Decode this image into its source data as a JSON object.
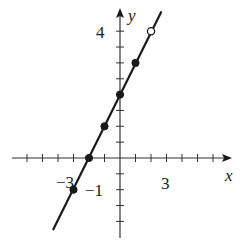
{
  "chart_data": {
    "type": "line",
    "title": "",
    "xlabel": "x",
    "ylabel": "y",
    "equation": "y = x + 2",
    "x_tick_labels": [
      "-3",
      "3"
    ],
    "y_tick_labels": [
      "4",
      "-1"
    ],
    "x_tick_step": 1,
    "y_tick_step": 0.5,
    "xlim": [
      -6.5,
      7
    ],
    "ylim": [
      -2.5,
      4.7
    ],
    "grid": false,
    "line": {
      "from": [
        -4.3,
        -2.25
      ],
      "to": [
        2.65,
        4.6
      ]
    },
    "points": [
      {
        "x": -3,
        "y": -1,
        "filled": true
      },
      {
        "x": -2,
        "y": 0,
        "filled": true
      },
      {
        "x": -1,
        "y": 1,
        "filled": true
      },
      {
        "x": 0,
        "y": 2,
        "filled": true
      },
      {
        "x": 1,
        "y": 3,
        "filled": true
      },
      {
        "x": 2,
        "y": 4,
        "filled": false
      }
    ]
  },
  "labels": {
    "x_axis": "x",
    "y_axis": "y",
    "x_neg3": "−3",
    "x_3": "3",
    "y_4": "4",
    "y_neg1": "−1"
  },
  "colors": {
    "ink": "#1a1a1a",
    "axis": "#333333",
    "background": "#ffffff"
  }
}
